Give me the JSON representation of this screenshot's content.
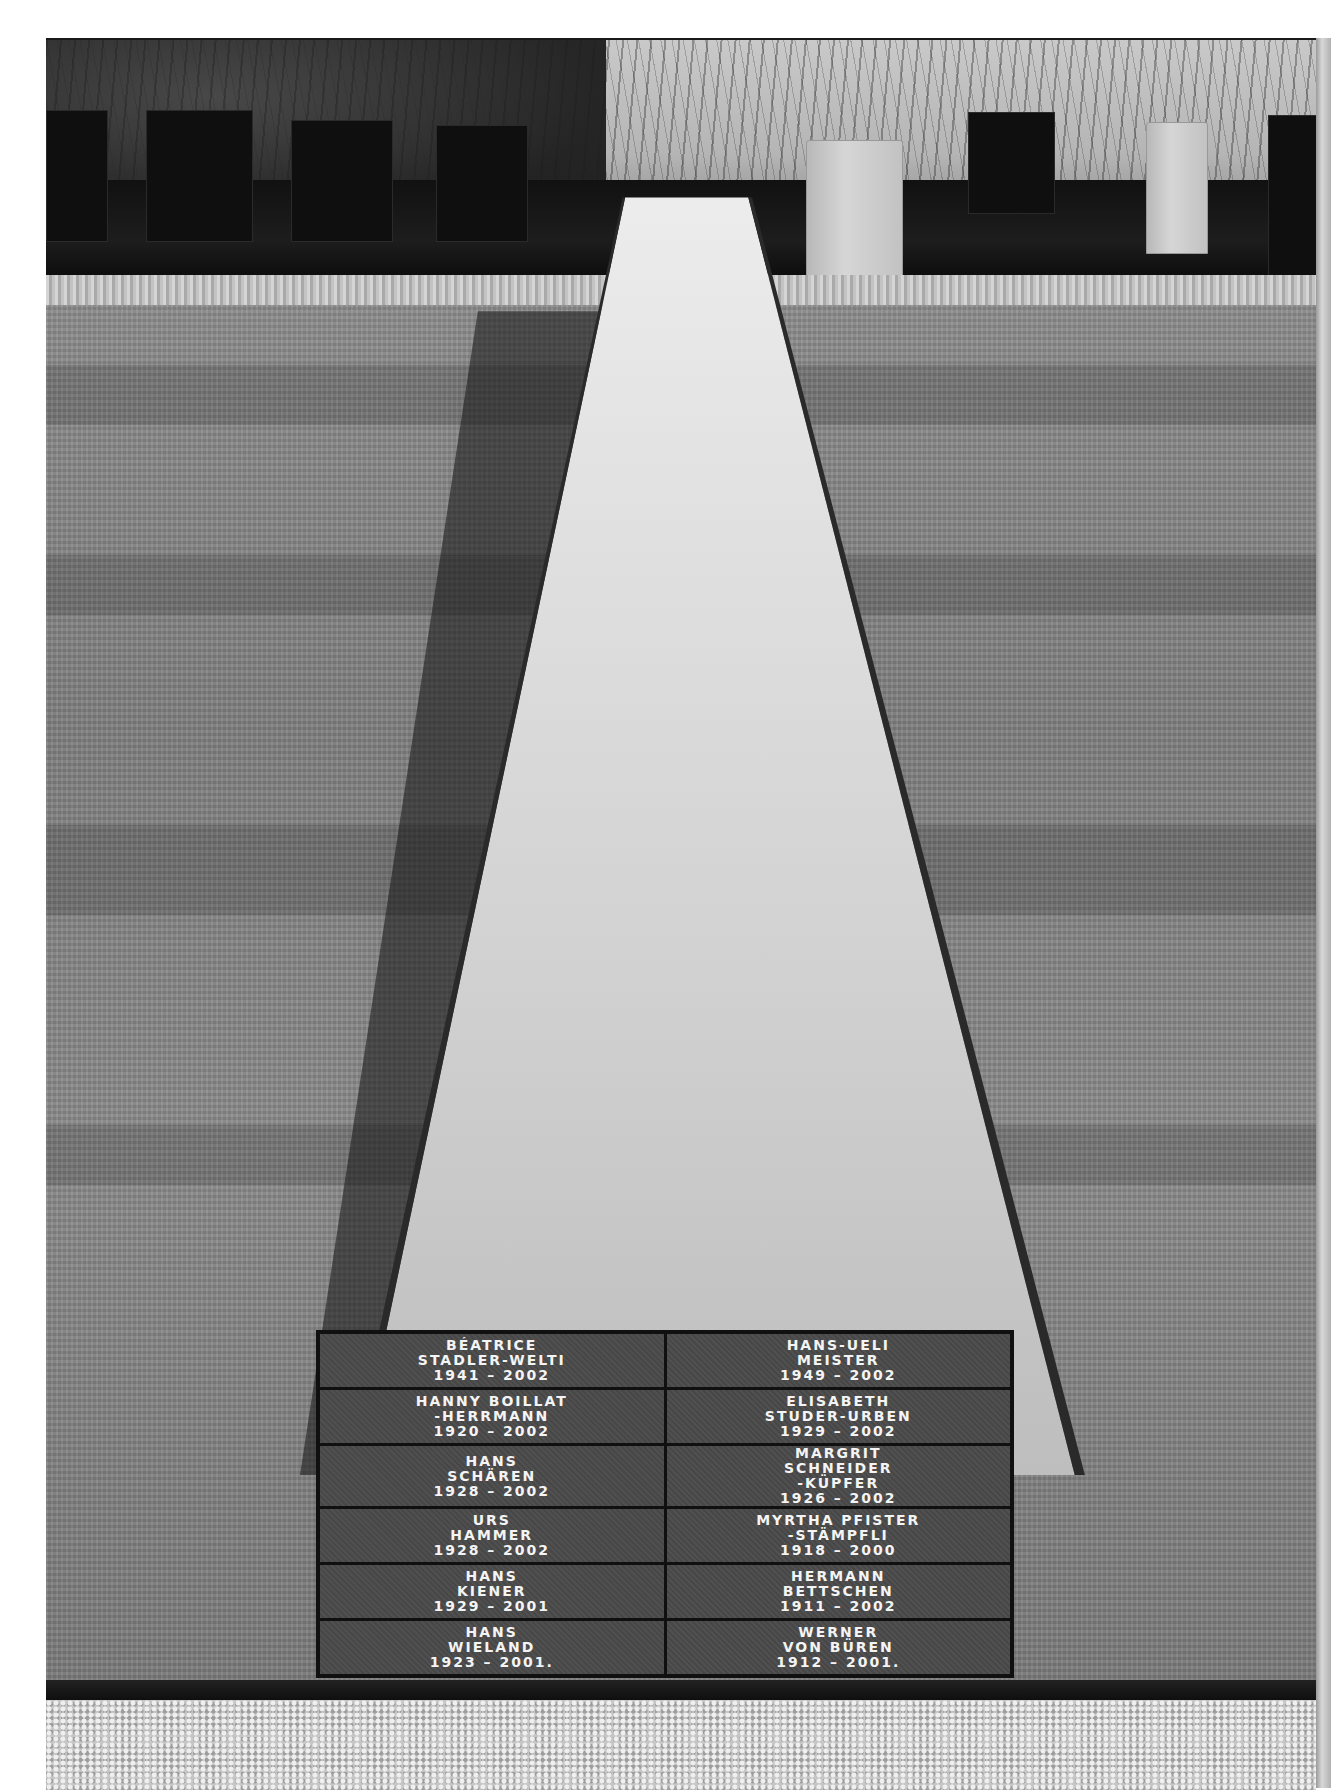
{
  "scene": {
    "description": "Black-and-white photograph of a cemetery memorial: a long reflective tapering stone path flanked by lawn, ending in engraved name plaques, with headstones and hedges in the background.",
    "plaques": [
      {
        "lines": [
          "BÉATRICE",
          "STADLER-WELTI",
          "1941 – 2002"
        ]
      },
      {
        "lines": [
          "HANS-UELI",
          "MEISTER",
          "1949 – 2002"
        ]
      },
      {
        "lines": [
          "HANNY BOILLAT",
          "-HERRMANN",
          "1920 – 2002"
        ]
      },
      {
        "lines": [
          "ELISABETH",
          "STUDER-URBEN",
          "1929 – 2002"
        ]
      },
      {
        "lines": [
          "HANS",
          "SCHÄREN",
          "1928 – 2002"
        ]
      },
      {
        "lines": [
          "MARGRIT",
          "SCHNEIDER",
          "-KÜPFER",
          "1926 – 2002"
        ]
      },
      {
        "lines": [
          "URS",
          "HAMMER",
          "1928 – 2002"
        ]
      },
      {
        "lines": [
          "MYRTHA PFISTER",
          "-STÄMPFLI",
          "1918 – 2000"
        ]
      },
      {
        "lines": [
          "HANS",
          "KIENER",
          "1929 – 2001"
        ]
      },
      {
        "lines": [
          "HERMANN",
          "BETTSCHEN",
          "1911 – 2002"
        ]
      },
      {
        "lines": [
          "HANS",
          "WIELAND",
          "1923 – 2001."
        ]
      },
      {
        "lines": [
          "WERNER",
          "VON BÜREN",
          "1912 – 2001."
        ]
      }
    ]
  }
}
